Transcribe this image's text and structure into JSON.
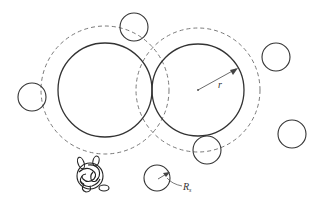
{
  "diagram": {
    "colors": {
      "stroke": "#333333",
      "dashed": "#777777",
      "background": "#ffffff"
    },
    "labels": {
      "radius_large": "r",
      "radius_small_main": "R",
      "radius_small_sub": "s"
    },
    "large_particles": [
      {
        "id": "left",
        "cx": 105,
        "cy": 90,
        "r": 47,
        "dashed_r": 64
      },
      {
        "id": "right",
        "cx": 198,
        "cy": 90,
        "r": 46,
        "dashed_r": 62
      }
    ],
    "small_particles": [
      {
        "id": "top",
        "cx": 134,
        "cy": 27,
        "r": 14
      },
      {
        "id": "left",
        "cx": 32,
        "cy": 97,
        "r": 14
      },
      {
        "id": "upper-right",
        "cx": 276,
        "cy": 57,
        "r": 14
      },
      {
        "id": "far-right",
        "cx": 292,
        "cy": 134,
        "r": 14
      },
      {
        "id": "bottom-middle",
        "cx": 207,
        "cy": 150,
        "r": 14
      },
      {
        "id": "bottom-labeled",
        "cx": 157,
        "cy": 178,
        "r": 13
      }
    ],
    "polymer_coil": {
      "cx": 89,
      "cy": 178
    }
  }
}
